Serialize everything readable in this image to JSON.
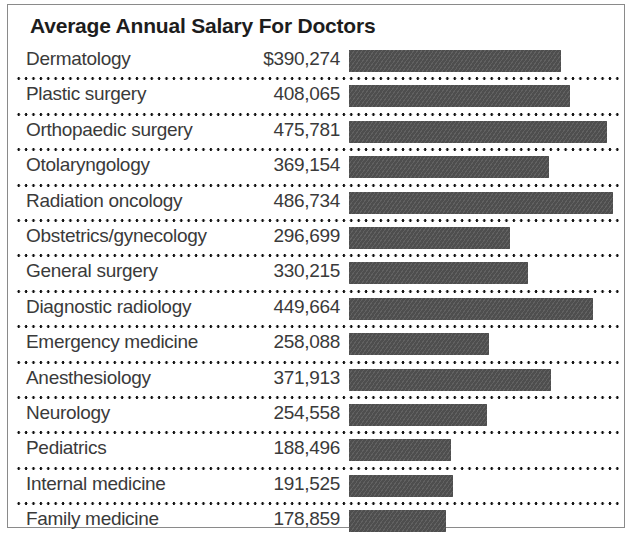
{
  "chart_data": {
    "type": "bar",
    "title": "Average Annual Salary For Doctors",
    "xlabel": "",
    "ylabel": "",
    "orientation": "horizontal",
    "grid": false,
    "legend": false,
    "value_prefix_first_row": "$",
    "axis_max": 500000,
    "categories": [
      "Dermatology",
      "Plastic surgery",
      "Orthopaedic surgery",
      "Otolaryngology",
      "Radiation oncology",
      "Obstetrics/gynecology",
      "General surgery",
      "Diagnostic radiology",
      "Emergency medicine",
      "Anesthesiology",
      "Neurology",
      "Pediatrics",
      "Internal medicine",
      "Family medicine"
    ],
    "values": [
      390274,
      408065,
      475781,
      369154,
      486734,
      296699,
      330215,
      449664,
      258088,
      371913,
      254558,
      188496,
      191525,
      178859
    ],
    "value_labels": [
      "$390,274",
      "408,065",
      "475,781",
      "369,154",
      "486,734",
      "296,699",
      "330,215",
      "449,664",
      "258,088",
      "371,913",
      "254,558",
      "188,496",
      "191,525",
      "178,859"
    ],
    "bar_color": "#4e4e4e"
  },
  "rows": [
    {
      "label": "Dermatology",
      "value_label": "$390,274",
      "value": 390274
    },
    {
      "label": "Plastic surgery",
      "value_label": "408,065",
      "value": 408065
    },
    {
      "label": "Orthopaedic surgery",
      "value_label": "475,781",
      "value": 475781
    },
    {
      "label": "Otolaryngology",
      "value_label": "369,154",
      "value": 369154
    },
    {
      "label": "Radiation oncology",
      "value_label": "486,734",
      "value": 486734
    },
    {
      "label": "Obstetrics/gynecology",
      "value_label": "296,699",
      "value": 296699
    },
    {
      "label": "General surgery",
      "value_label": "330,215",
      "value": 330215
    },
    {
      "label": "Diagnostic radiology",
      "value_label": "449,664",
      "value": 449664
    },
    {
      "label": "Emergency medicine",
      "value_label": "258,088",
      "value": 258088
    },
    {
      "label": "Anesthesiology",
      "value_label": "371,913",
      "value": 371913
    },
    {
      "label": "Neurology",
      "value_label": "254,558",
      "value": 254558
    },
    {
      "label": "Pediatrics",
      "value_label": "188,496",
      "value": 188496
    },
    {
      "label": "Internal medicine",
      "value_label": "191,525",
      "value": 191525
    },
    {
      "label": "Family medicine",
      "value_label": "178,859",
      "value": 178859
    }
  ]
}
